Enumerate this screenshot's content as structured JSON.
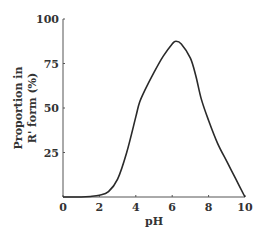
{
  "chart_data": {
    "type": "line",
    "title": "",
    "xlabel": "pH",
    "ylabel_lines": [
      "Proportion in",
      "R' form (%)"
    ],
    "xlim": [
      0,
      10
    ],
    "ylim": [
      0,
      100
    ],
    "x_ticks": [
      0,
      2,
      4,
      6,
      8,
      10
    ],
    "y_ticks": [
      25,
      50,
      75,
      100
    ],
    "y_tick_labels": [
      "25",
      "50",
      "75",
      "100"
    ],
    "x_tick_labels": [
      "0",
      "2",
      "4",
      "6",
      "8",
      "10"
    ],
    "grid": false,
    "legend": "none",
    "series": [
      {
        "name": "R' form",
        "color": "#2a2a2a",
        "x": [
          0,
          1.0,
          1.5,
          2.0,
          2.5,
          3.0,
          3.5,
          4.0,
          4.2,
          4.5,
          5.0,
          5.5,
          6.0,
          6.2,
          6.5,
          7.0,
          7.3,
          7.6,
          8.0,
          8.5,
          9.0,
          9.5,
          10.0
        ],
        "y": [
          0,
          0,
          0.3,
          1,
          3,
          10,
          25,
          45,
          53,
          60,
          70,
          79,
          86,
          87.5,
          86,
          78,
          68,
          55,
          43,
          30,
          20,
          10,
          0
        ]
      }
    ]
  }
}
